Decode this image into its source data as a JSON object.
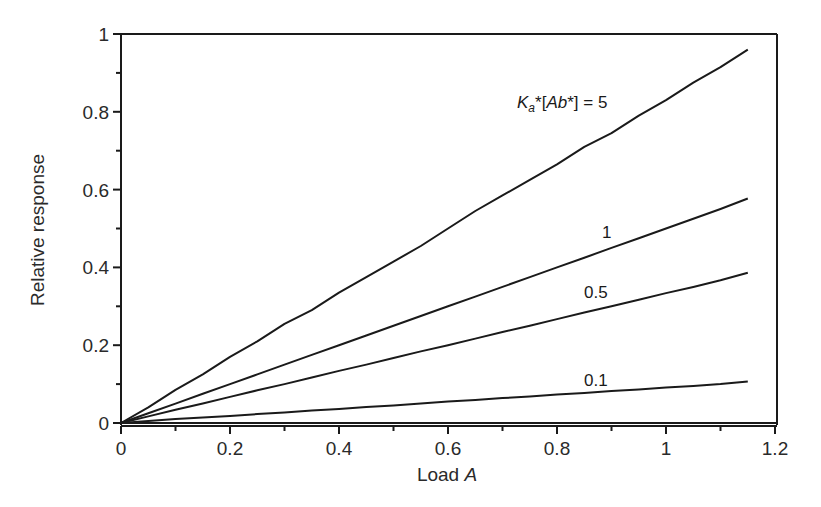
{
  "chart_data": {
    "type": "line",
    "title": "",
    "xlabel": "Load A",
    "ylabel": "Relative response",
    "xlim": [
      0,
      1.2
    ],
    "ylim": [
      0,
      1
    ],
    "grid": false,
    "legend": "inline labels",
    "x_ticks": [
      "0",
      "0.2",
      "0.4",
      "0.6",
      "0.8",
      "1",
      "1.2"
    ],
    "y_ticks": [
      "0",
      "0.2",
      "0.4",
      "0.6",
      "0.8",
      "1"
    ],
    "x": [
      0,
      0.05,
      0.1,
      0.15,
      0.2,
      0.25,
      0.3,
      0.35,
      0.4,
      0.45,
      0.5,
      0.55,
      0.6,
      0.65,
      0.7,
      0.75,
      0.8,
      0.85,
      0.9,
      0.95,
      1.0,
      1.05,
      1.1,
      1.15
    ],
    "series": [
      {
        "name": "Ka*[Ab*] = 5",
        "label": "K_a*[Ab*] = 5",
        "values": [
          0,
          0.04,
          0.085,
          0.125,
          0.17,
          0.21,
          0.255,
          0.29,
          0.335,
          0.375,
          0.415,
          0.455,
          0.5,
          0.545,
          0.585,
          0.625,
          0.665,
          0.71,
          0.745,
          0.79,
          0.83,
          0.875,
          0.915,
          0.96
        ]
      },
      {
        "name": "1",
        "label": "1",
        "values": [
          0,
          0.025,
          0.05,
          0.075,
          0.1,
          0.125,
          0.15,
          0.175,
          0.2,
          0.225,
          0.25,
          0.275,
          0.3,
          0.325,
          0.35,
          0.375,
          0.4,
          0.425,
          0.45,
          0.475,
          0.5,
          0.525,
          0.55,
          0.577
        ]
      },
      {
        "name": "0.5",
        "label": "0.5",
        "values": [
          0,
          0.017,
          0.034,
          0.05,
          0.067,
          0.084,
          0.1,
          0.117,
          0.134,
          0.15,
          0.167,
          0.184,
          0.2,
          0.217,
          0.234,
          0.25,
          0.267,
          0.284,
          0.3,
          0.317,
          0.334,
          0.35,
          0.367,
          0.386
        ]
      },
      {
        "name": "0.1",
        "label": "0.1",
        "values": [
          0,
          0.005,
          0.01,
          0.014,
          0.018,
          0.023,
          0.027,
          0.032,
          0.036,
          0.041,
          0.045,
          0.05,
          0.055,
          0.059,
          0.064,
          0.068,
          0.073,
          0.077,
          0.082,
          0.086,
          0.091,
          0.095,
          0.1,
          0.107
        ]
      }
    ],
    "annotations": [
      {
        "text": "K_a*[Ab*] = 5",
        "x": 0.73,
        "y": 0.82
      },
      {
        "text": "1",
        "x": 0.89,
        "y": 0.49
      },
      {
        "text": "0.5",
        "x": 0.87,
        "y": 0.33
      },
      {
        "text": "0.1",
        "x": 0.87,
        "y": 0.1
      }
    ]
  },
  "labels": {
    "xlabel_main": "Load ",
    "xlabel_italic": "A",
    "ylabel": "Relative response",
    "k_label_K": "K",
    "k_label_sub": "a",
    "k_label_star1": "*[",
    "k_label_Ab": "Ab",
    "k_label_rest": "*] = 5",
    "curve_1": "1",
    "curve_05": "0.5",
    "curve_01": "0.1"
  }
}
